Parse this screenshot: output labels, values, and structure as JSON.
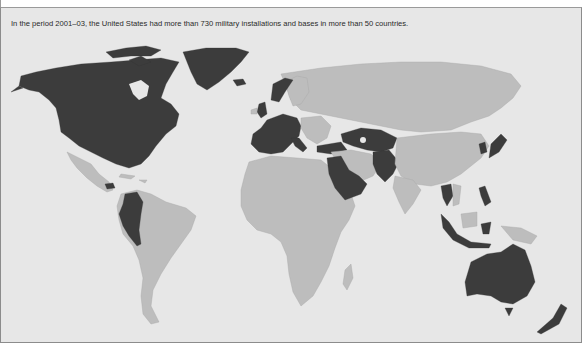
{
  "caption": "In the period 2001–03, the United States had more than 730 military installations and bases in more than 50 countries.",
  "map": {
    "type": "world choropleth",
    "colors": {
      "background": "#e7e7e7",
      "no_us_base": "#bdbdbd",
      "us_base": "#3c3c3c"
    },
    "legend_categories": [
      {
        "key": "us_base",
        "meaning": "Country hosting US military installations/bases (2001–03)"
      },
      {
        "key": "no_us_base",
        "meaning": "Other countries"
      }
    ],
    "highlighted_regions": [
      "United States",
      "Canada",
      "Greenland",
      "Iceland",
      "United Kingdom",
      "Norway",
      "Germany",
      "France",
      "Spain",
      "Portugal",
      "Italy",
      "Belgium",
      "Netherlands",
      "Turkey",
      "Greece",
      "Saudi Arabia",
      "Kuwait",
      "Qatar",
      "Bahrain",
      "United Arab Emirates",
      "Oman",
      "Kazakhstan",
      "Uzbekistan",
      "Kyrgyzstan",
      "Tajikistan",
      "Afghanistan",
      "Pakistan",
      "Japan",
      "South Korea",
      "Thailand",
      "Philippines",
      "Singapore",
      "Indonesia",
      "Australia",
      "New Zealand",
      "Honduras",
      "Colombia",
      "Ecuador",
      "Peru"
    ]
  }
}
